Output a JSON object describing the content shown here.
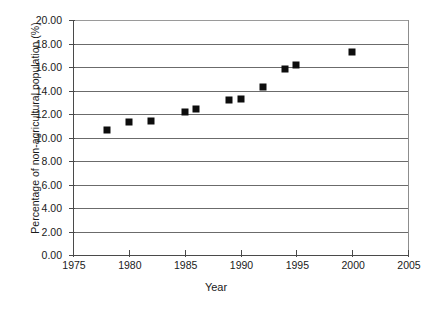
{
  "chart_data": {
    "type": "scatter",
    "title": "",
    "xlabel": "Year",
    "ylabel": "Percentage of non-agricultural population (%)",
    "xlim": [
      1975,
      2005
    ],
    "ylim": [
      0,
      20
    ],
    "grid": true,
    "legend": "none",
    "marker": "filled-square",
    "marker_color": "#0d0d0d",
    "xticks": [
      "1975",
      "1980",
      "1985",
      "1990",
      "1995",
      "2000",
      "2005"
    ],
    "xtick_values": [
      1975,
      1980,
      1985,
      1990,
      1995,
      2000,
      2005
    ],
    "yticks": [
      "0.00",
      "2.00",
      "4.00",
      "6.00",
      "8.00",
      "10.00",
      "12.00",
      "14.00",
      "16.00",
      "18.00",
      "20.00"
    ],
    "ytick_values": [
      0,
      2,
      4,
      6,
      8,
      10,
      12,
      14,
      16,
      18,
      20
    ],
    "x": [
      1978,
      1980,
      1982,
      1985,
      1986,
      1989,
      1990,
      1992,
      1994,
      1995,
      2000
    ],
    "values": [
      10.6,
      11.3,
      11.4,
      12.2,
      12.4,
      13.2,
      13.3,
      14.3,
      15.8,
      16.2,
      17.3
    ],
    "points": [
      {
        "x": 1978,
        "y": 10.6
      },
      {
        "x": 1980,
        "y": 11.3
      },
      {
        "x": 1982,
        "y": 11.4
      },
      {
        "x": 1985,
        "y": 12.2
      },
      {
        "x": 1986,
        "y": 12.4
      },
      {
        "x": 1989,
        "y": 13.2
      },
      {
        "x": 1990,
        "y": 13.3
      },
      {
        "x": 1992,
        "y": 14.3
      },
      {
        "x": 1994,
        "y": 15.8
      },
      {
        "x": 1995,
        "y": 16.2
      },
      {
        "x": 2000,
        "y": 17.3
      }
    ]
  }
}
